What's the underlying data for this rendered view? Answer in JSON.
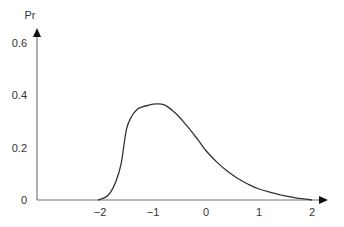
{
  "chart_data": {
    "type": "line",
    "title": "",
    "xlabel": "",
    "ylabel": "Pr",
    "xlim": [
      -2.6,
      2.3
    ],
    "ylim": [
      0,
      0.66
    ],
    "grid": false,
    "legend": null,
    "x_ticks": [
      -2,
      -1,
      0,
      1,
      2
    ],
    "x_tick_labels": [
      "−2",
      "−1",
      "0",
      "1",
      "2"
    ],
    "y_ticks": [
      0,
      0.2,
      0.4,
      0.6
    ],
    "y_tick_labels": [
      "0",
      "0.2",
      "0.4",
      "0.6"
    ],
    "series": [
      {
        "name": "Pr",
        "color": "#333333",
        "x": [
          -2.04,
          -1.9,
          -1.8,
          -1.7,
          -1.6,
          -1.5,
          -1.4,
          -1.3,
          -1.2,
          -1.1,
          -1.0,
          -0.9,
          -0.8,
          -0.7,
          -0.6,
          -0.5,
          -0.4,
          -0.3,
          -0.2,
          -0.1,
          0.0,
          0.2,
          0.4,
          0.6,
          0.8,
          1.0,
          1.2,
          1.4,
          1.6,
          1.8,
          2.0
        ],
        "values": [
          0.0,
          0.01,
          0.03,
          0.07,
          0.14,
          0.27,
          0.32,
          0.345,
          0.355,
          0.36,
          0.365,
          0.366,
          0.363,
          0.352,
          0.335,
          0.315,
          0.292,
          0.268,
          0.242,
          0.215,
          0.188,
          0.145,
          0.11,
          0.082,
          0.06,
          0.042,
          0.03,
          0.02,
          0.012,
          0.005,
          0.0
        ]
      }
    ]
  },
  "axes": {
    "y_title": "Pr"
  }
}
